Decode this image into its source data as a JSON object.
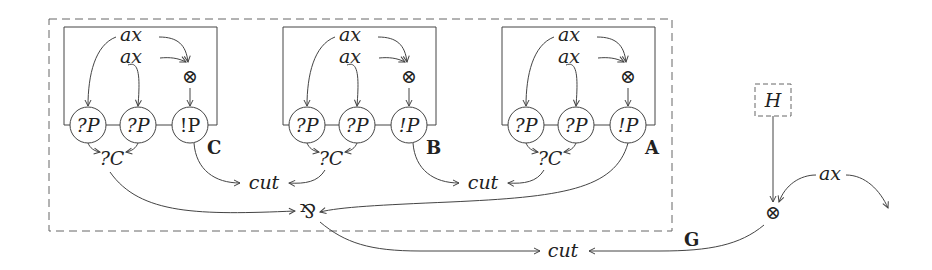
{
  "diagram": {
    "outer_box_label": "G",
    "external_box_label": "H",
    "subnets": [
      {
        "id": "C",
        "label": "C",
        "ax_top": "ax",
        "ax_second": "ax",
        "tensor": "⊗",
        "nodes": [
          "?P",
          "?P",
          "!P"
        ],
        "contraction": "?C"
      },
      {
        "id": "B",
        "label": "B",
        "ax_top": "ax",
        "ax_second": "ax",
        "tensor": "⊗",
        "nodes": [
          "?P",
          "?P",
          "!P"
        ],
        "contraction": "?C"
      },
      {
        "id": "A",
        "label": "A",
        "ax_top": "ax",
        "ax_second": "ax",
        "tensor": "⊗",
        "nodes": [
          "?P",
          "?P",
          "!P"
        ],
        "contraction": "?C"
      }
    ],
    "cuts": [
      "cut",
      "cut",
      "cut"
    ],
    "par": "⅋",
    "external_tensor": "⊗",
    "external_ax": "ax"
  }
}
